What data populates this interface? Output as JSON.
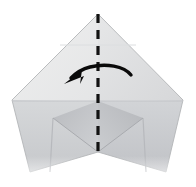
{
  "figure": {
    "name": "origami-fold-diagram",
    "title": "Origami step: fold right half to the left along vertical center crease",
    "canvas": {
      "width": 196,
      "height": 187,
      "background": "#ffffff"
    }
  },
  "paper": {
    "material_name": "folded-paper",
    "colors": {
      "front_light": "#ececed",
      "front_mid": "#e2e3e4",
      "right_panel": "#d9dadc",
      "lower_left": "#cfd1d3",
      "lower_right": "#c8cacd",
      "inner_shadow": "#b9bbbe",
      "edge_line": "#b3b5b8",
      "crease_line": "#cdcfd2"
    },
    "vertices": {
      "apex_top": [
        98,
        14
      ],
      "left_point": [
        12,
        100
      ],
      "right_point": [
        183,
        100
      ],
      "bottom_left_tip": [
        30,
        170
      ],
      "bottom_right_tip": [
        166,
        170
      ],
      "center_notch": [
        98,
        152
      ]
    }
  },
  "fold_line": {
    "label": "vertical-center-fold",
    "style": "dashed",
    "color": "#121212",
    "x": 98,
    "y_start": 14,
    "y_end": 154,
    "dash": "9 7",
    "width": 3.2
  },
  "arrow": {
    "label": "fold-left-arrow",
    "direction": "right-to-left",
    "color": "#0a0a0a",
    "start": [
      131,
      75
    ],
    "end": [
      67,
      83
    ],
    "head_at": [
      67,
      83
    ]
  },
  "creases": [
    {
      "name": "upper-horizontal-crease",
      "y": 45,
      "x_start": 60,
      "x_end": 136
    },
    {
      "name": "mid-horizontal-crease",
      "y": 101,
      "x_start": 12,
      "x_end": 183
    },
    {
      "name": "left-vertical-crease",
      "x": 53,
      "y_start": 118,
      "y_end": 170
    },
    {
      "name": "right-vertical-crease",
      "x": 143,
      "y_start": 118,
      "y_end": 170
    }
  ]
}
